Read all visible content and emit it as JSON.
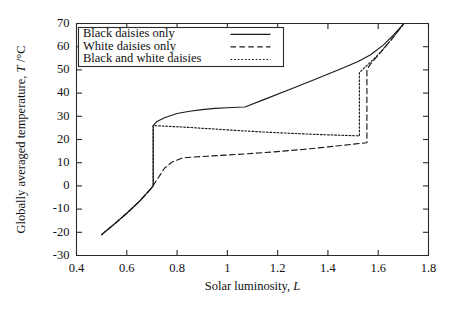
{
  "chart_data": {
    "type": "line",
    "title": "",
    "xlabel": "Solar luminosity, L",
    "xlabel_plain": "Solar luminosity,",
    "xlabel_italic": "L",
    "ylabel": "Globally averaged temperature, T /°C",
    "ylabel_plain_a": "Globally averaged temperature,",
    "ylabel_italic": "T",
    "ylabel_plain_b": "/°C",
    "xlim": [
      0.4,
      1.8
    ],
    "ylim": [
      -30,
      70
    ],
    "xticks": [
      0.4,
      0.6,
      0.8,
      1.0,
      1.2,
      1.4,
      1.6,
      1.8
    ],
    "xticklabels": [
      "0.4",
      "0.6",
      "0.8",
      "1",
      "1.2",
      "1.4",
      "1.6",
      "1.8"
    ],
    "yticks": [
      -30,
      -20,
      -10,
      0,
      10,
      20,
      30,
      40,
      50,
      60,
      70
    ],
    "yticklabels": [
      "-30",
      "-20",
      "-10",
      "0",
      "10",
      "20",
      "30",
      "40",
      "50",
      "60",
      "70"
    ],
    "grid": false,
    "legend_position": "upper left",
    "line_color": "#1a1a1a",
    "axis_color": "#2b2b2b",
    "series": [
      {
        "name": "Black daisies only",
        "style": "solid",
        "x": [
          0.5,
          0.55,
          0.6,
          0.65,
          0.695,
          0.705,
          0.705,
          0.72,
          0.75,
          0.8,
          0.85,
          0.9,
          0.95,
          1.0,
          1.04,
          1.07,
          1.15,
          1.25,
          1.35,
          1.45,
          1.52,
          1.57,
          1.62,
          1.66,
          1.7
        ],
        "y": [
          -21.0,
          -16.5,
          -11.8,
          -6.7,
          -1.3,
          0.0,
          26.0,
          27.8,
          29.4,
          31.2,
          32.2,
          32.9,
          33.4,
          33.7,
          33.9,
          34.0,
          37.4,
          41.7,
          46.0,
          50.4,
          53.6,
          56.5,
          60.7,
          65.0,
          69.7
        ]
      },
      {
        "name": "White daisies only",
        "style": "dashed",
        "x": [
          0.5,
          0.55,
          0.6,
          0.65,
          0.695,
          0.705,
          0.75,
          0.78,
          0.82,
          0.86,
          0.92,
          1.0,
          1.1,
          1.2,
          1.3,
          1.4,
          1.46,
          1.51,
          1.545,
          1.555,
          1.555,
          1.57,
          1.61,
          1.65,
          1.7
        ],
        "y": [
          -21.0,
          -16.5,
          -11.8,
          -6.7,
          -1.3,
          0.2,
          7.6,
          10.3,
          12.0,
          12.4,
          12.8,
          13.3,
          14.0,
          14.8,
          15.7,
          16.8,
          17.5,
          18.1,
          18.5,
          18.6,
          50.2,
          52.6,
          57.6,
          62.7,
          69.7
        ]
      },
      {
        "name": "Black and white daisies",
        "style": "dotted",
        "x": [
          0.5,
          0.55,
          0.6,
          0.65,
          0.695,
          0.705,
          0.705,
          0.73,
          0.78,
          0.85,
          0.95,
          1.05,
          1.15,
          1.25,
          1.35,
          1.43,
          1.49,
          1.515,
          1.525,
          1.525,
          1.55,
          1.6,
          1.65,
          1.7
        ],
        "y": [
          -21.0,
          -16.5,
          -11.8,
          -6.7,
          -1.3,
          0.0,
          26.0,
          25.9,
          25.6,
          25.2,
          24.5,
          23.8,
          23.2,
          22.7,
          22.2,
          21.9,
          21.7,
          21.6,
          21.5,
          48.8,
          51.4,
          56.6,
          62.8,
          69.7
        ]
      }
    ],
    "legend_entries": [
      {
        "label": "Black daisies only",
        "style": "solid"
      },
      {
        "label": "White daisies only",
        "style": "dashed"
      },
      {
        "label": "Black and white daisies",
        "style": "dotted"
      }
    ]
  }
}
